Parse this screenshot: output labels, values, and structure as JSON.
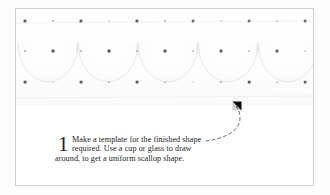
{
  "figure": {
    "kind": "craft-instruction-diagram",
    "frame_border_color": "#cfcfcf",
    "page_background": "#ffffff"
  },
  "fabric": {
    "name": "white-polka-dot-fabric-photo",
    "background_color": "#ffffff",
    "dot_color_dark": "#5c5c66",
    "dot_color_light": "#b9b9c2",
    "scallop_line_color": "#e2e2e6",
    "dot_rows": 3,
    "dot_columns": 11,
    "dot_row_y": [
      9,
      39,
      70
    ],
    "dot_col_x": [
      9,
      37,
      65,
      93,
      121,
      149,
      177,
      205,
      233,
      261,
      289
    ],
    "scallop_count": 5,
    "scallop_width": 60,
    "scallop_label": "pencil-drawn scallop template outline"
  },
  "instruction": {
    "step_number": "1",
    "lines": [
      "Make a template for the finished shape",
      "required. Use a cup or glass to draw",
      "around, to get a uniform scallop shape."
    ],
    "full_text": "Make a template for the finished shape required. Use a cup or glass to draw around, to get a uniform scallop shape.",
    "text_color": "#242424"
  },
  "leader": {
    "name": "dashed-leader-line-with-arrowhead",
    "line_color": "#4a4a4a",
    "arrow_color": "#0d0d0d",
    "dash_pattern": "3 3",
    "arrow_direction": "up-left",
    "arrow_tip": {
      "x": 233,
      "y": 102
    }
  }
}
